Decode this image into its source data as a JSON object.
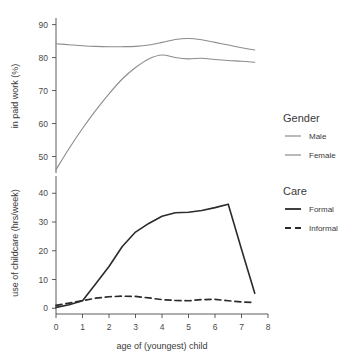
{
  "chart_data": [
    {
      "type": "line",
      "panel": "top",
      "title": "",
      "xlabel": "age of (youngest) child",
      "ylabel": "in paid work (%)",
      "xlim": [
        0,
        8
      ],
      "ylim": [
        45,
        92
      ],
      "xticks": [
        0,
        1,
        2,
        3,
        4,
        5,
        6,
        7,
        8
      ],
      "yticks": [
        50,
        60,
        70,
        80,
        90
      ],
      "grid": false,
      "legend_position": "right",
      "x": [
        0,
        0.5,
        1,
        1.5,
        2,
        2.5,
        3,
        3.5,
        4,
        4.5,
        5,
        5.5,
        6,
        6.5,
        7,
        7.5
      ],
      "series": [
        {
          "name": "Male",
          "color": "#8c8c8c",
          "dash": "none",
          "values": [
            84.2,
            83.9,
            83.6,
            83.4,
            83.3,
            83.3,
            83.4,
            83.8,
            84.6,
            85.5,
            85.8,
            85.4,
            84.6,
            83.8,
            83.0,
            82.3
          ]
        },
        {
          "name": "Female",
          "color": "#8c8c8c",
          "dash": "none",
          "values": [
            46.0,
            52.5,
            58.5,
            64.0,
            69.0,
            73.5,
            77.0,
            79.6,
            80.8,
            80.0,
            79.6,
            79.8,
            79.4,
            79.1,
            78.9,
            78.6
          ]
        }
      ]
    },
    {
      "type": "line",
      "panel": "bottom",
      "title": "",
      "xlabel": "age of (youngest) child",
      "ylabel": "use of childcare (hrs/week)",
      "xlim": [
        0,
        8
      ],
      "ylim": [
        -2,
        46
      ],
      "xticks": [
        0,
        1,
        2,
        3,
        4,
        5,
        6,
        7,
        8
      ],
      "yticks": [
        0,
        10,
        20,
        30,
        40
      ],
      "grid": false,
      "legend_position": "right",
      "x": [
        0,
        0.5,
        1,
        1.5,
        2,
        2.5,
        3,
        3.5,
        4,
        4.5,
        5,
        5.5,
        6,
        6.5,
        7,
        7.5
      ],
      "series": [
        {
          "name": "Formal",
          "color": "#2b2b2b",
          "dash": "none",
          "values": [
            0.3,
            1.2,
            2.6,
            8.5,
            14.5,
            21.5,
            26.5,
            29.5,
            32.0,
            33.2,
            33.4,
            34.0,
            35.0,
            36.2,
            20.5,
            5.2
          ]
        },
        {
          "name": "Informal",
          "color": "#2b2b2b",
          "dash": "dashed",
          "values": [
            1.0,
            1.8,
            2.6,
            3.5,
            4.0,
            4.2,
            4.1,
            3.6,
            3.0,
            2.7,
            2.6,
            3.0,
            3.1,
            2.6,
            2.2,
            2.0
          ]
        }
      ]
    }
  ],
  "axes": {
    "top": {
      "ylabel": "in paid work (%)",
      "ytick_labels": [
        "50",
        "60",
        "70",
        "80",
        "90"
      ]
    },
    "bottom": {
      "ylabel": "use of childcare (hrs/week)",
      "ytick_labels": [
        "0",
        "10",
        "20",
        "30",
        "40"
      ]
    },
    "x": {
      "label": "age of (youngest) child",
      "tick_labels": [
        "0",
        "1",
        "2",
        "3",
        "4",
        "5",
        "6",
        "7",
        "8"
      ]
    }
  },
  "legend": {
    "groups": [
      {
        "title": "Gender",
        "entries": [
          {
            "label": "Male",
            "color": "#8c8c8c",
            "style": "solid"
          },
          {
            "label": "Female",
            "color": "#8c8c8c",
            "style": "solid"
          }
        ]
      },
      {
        "title": "Care",
        "entries": [
          {
            "label": "Formal",
            "color": "#2b2b2b",
            "style": "solid"
          },
          {
            "label": "Informal",
            "color": "#2b2b2b",
            "style": "dashed"
          }
        ]
      }
    ]
  },
  "colors": {
    "gender_line": "#8c8c8c",
    "care_line": "#2b2b2b",
    "axis": "#4a4a4a",
    "text": "#3a3a3a",
    "background": "#ffffff"
  }
}
